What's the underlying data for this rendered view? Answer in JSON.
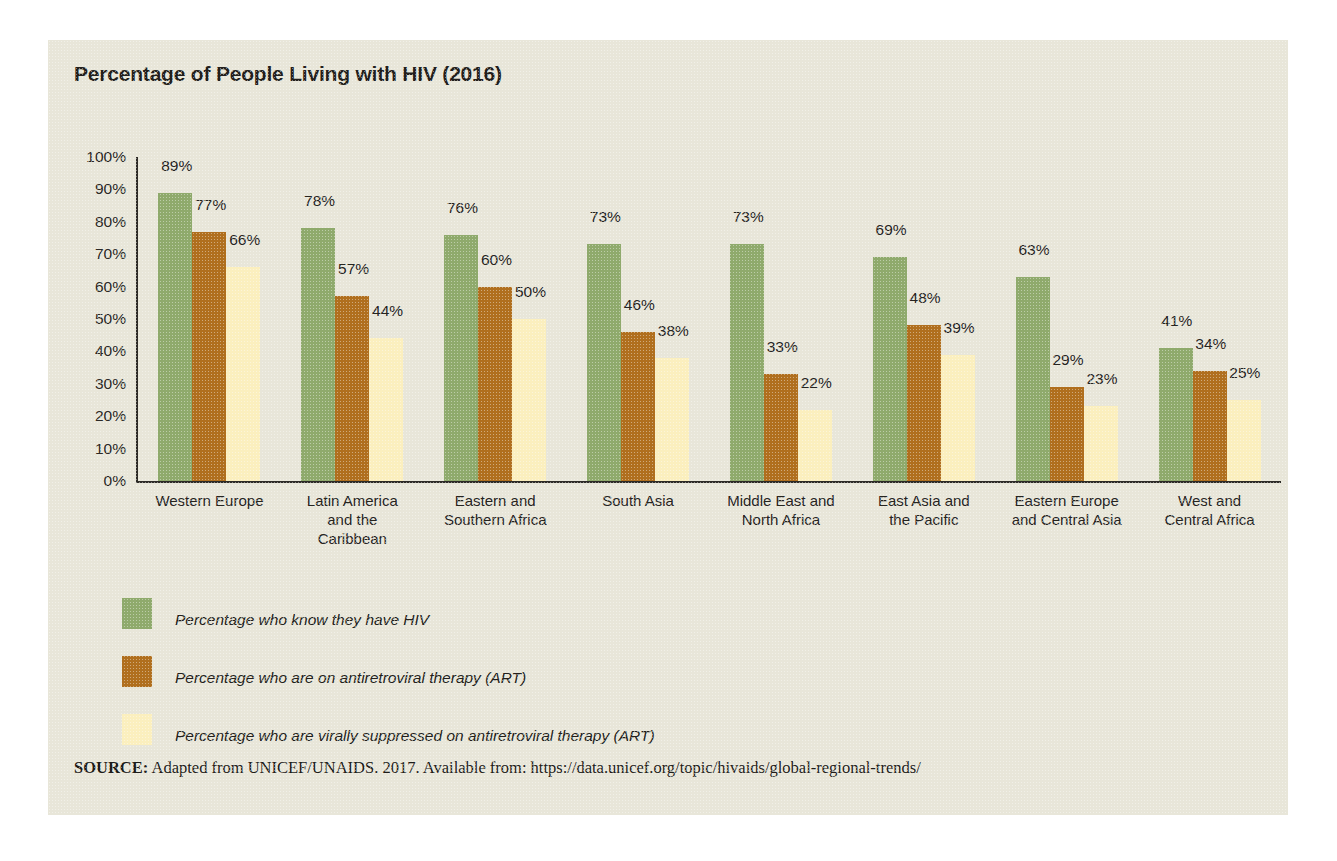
{
  "chart_title": "Percentage of People Living with HIV (2016)",
  "colors": {
    "card_background": "#e8e6d9",
    "page_background": "#ffffff",
    "axis": "#2c2a26",
    "text": "#231f1c",
    "series_green": "#8faa6c",
    "series_brown": "#b06f1e",
    "series_cream": "#fbefbe"
  },
  "legend": {
    "items": [
      {
        "label": "Percentage who know they have HIV",
        "color": "#8faa6c",
        "swatch_name": "legend-swatch-know-hiv"
      },
      {
        "label": "Percentage who are on antiretroviral therapy (ART)",
        "color": "#b06f1e",
        "swatch_name": "legend-swatch-on-art"
      },
      {
        "label": "Percentage who are virally suppressed on antiretroviral therapy (ART)",
        "color": "#fbefbe",
        "swatch_name": "legend-swatch-virally-suppressed"
      }
    ]
  },
  "source": {
    "label": "SOURCE:",
    "text": " Adapted from UNICEF/UNAIDS. 2017. Available from: https://data.unicef.org/topic/hivaids/global-regional-trends/"
  },
  "chart_data": {
    "type": "bar",
    "title": "Percentage of People Living with HIV (2016)",
    "xlabel": "",
    "ylabel": "",
    "ylim": [
      0,
      100
    ],
    "grid": false,
    "legend_position": "below",
    "y_ticks": [
      "0%",
      "10%",
      "20%",
      "30%",
      "40%",
      "50%",
      "60%",
      "70%",
      "80%",
      "90%",
      "100%"
    ],
    "y_tick_values": [
      0,
      10,
      20,
      30,
      40,
      50,
      60,
      70,
      80,
      90,
      100
    ],
    "value_suffix": "%",
    "categories": [
      "Western Europe",
      "Latin America\nand the\nCaribbean",
      "Eastern and\nSouthern Africa",
      "South Asia",
      "Middle East and\nNorth Africa",
      "East Asia and\nthe Pacific",
      "Eastern Europe\nand Central Asia",
      "West and\nCentral Africa"
    ],
    "series": [
      {
        "name": "Percentage who know they have HIV",
        "color": "#8faa6c",
        "values": [
          89,
          78,
          76,
          73,
          73,
          69,
          63,
          41
        ],
        "labels": [
          "89%",
          "78%",
          "76%",
          "73%",
          "73%",
          "69%",
          "63%",
          "41%"
        ]
      },
      {
        "name": "Percentage who are on antiretroviral therapy (ART)",
        "color": "#b06f1e",
        "values": [
          77,
          57,
          60,
          46,
          33,
          48,
          29,
          34
        ],
        "labels": [
          "77%",
          "57%",
          "60%",
          "46%",
          "33%",
          "48%",
          "29%",
          "34%"
        ]
      },
      {
        "name": "Percentage who are virally suppressed on antiretroviral therapy (ART)",
        "color": "#fbefbe",
        "values": [
          66,
          44,
          50,
          38,
          22,
          39,
          23,
          25
        ],
        "labels": [
          "66%",
          "44%",
          "50%",
          "38%",
          "22%",
          "39%",
          "23%",
          "25%"
        ]
      }
    ]
  }
}
